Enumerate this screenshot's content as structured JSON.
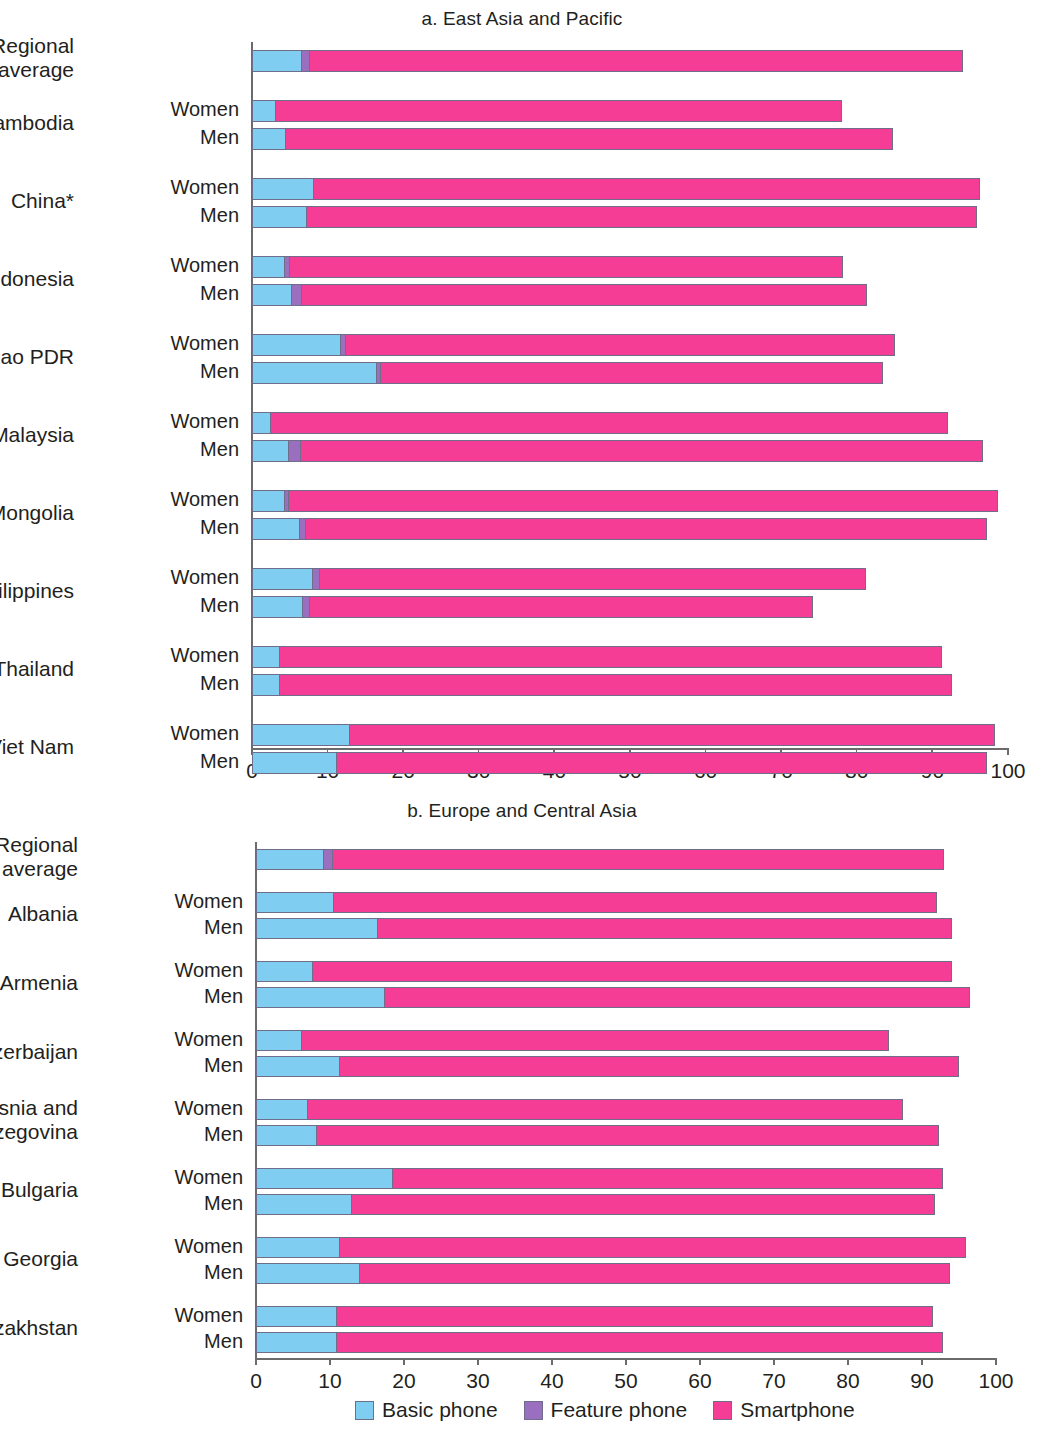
{
  "legend": {
    "items": [
      {
        "label": "Basic phone",
        "color": "#7fcdf0",
        "icon": "legend-swatch-basic"
      },
      {
        "label": "Feature phone",
        "color": "#9a6fc0",
        "icon": "legend-swatch-feature"
      },
      {
        "label": "Smartphone",
        "color": "#f53d96",
        "icon": "legend-swatch-smart"
      }
    ]
  },
  "gender": {
    "women": "Women",
    "men": "Men"
  },
  "chart_data": [
    {
      "type": "bar",
      "id": "panel-a",
      "title": "a. East Asia and Pacific",
      "orientation": "horizontal",
      "stacked": true,
      "xlabel": "",
      "ylabel": "",
      "xlim": [
        0,
        100
      ],
      "xticks": [
        0,
        10,
        20,
        30,
        40,
        50,
        60,
        70,
        80,
        90,
        100
      ],
      "grid": false,
      "legend_position": "bottom",
      "series": [
        {
          "name": "Basic phone",
          "color": "#7fcdf0"
        },
        {
          "name": "Feature phone",
          "color": "#9a6fc0"
        },
        {
          "name": "Smartphone",
          "color": "#f53d96"
        }
      ],
      "groups": [
        {
          "category": "Regional average",
          "single": true,
          "rows": [
            {
              "gender": "",
              "basic": 6.6,
              "feature": 1.1,
              "smart": 86.3,
              "total": 94.0
            }
          ]
        },
        {
          "category": "Cambodia",
          "single": false,
          "rows": [
            {
              "gender": "Women",
              "basic": 3.2,
              "feature": 0.0,
              "smart": 74.8,
              "total": 78.0
            },
            {
              "gender": "Men",
              "basic": 4.5,
              "feature": 0.0,
              "smart": 80.3,
              "total": 84.8
            }
          ]
        },
        {
          "category": "China*",
          "single": false,
          "rows": [
            {
              "gender": "Women",
              "basic": 8.2,
              "feature": 0.0,
              "smart": 88.1,
              "total": 96.3
            },
            {
              "gender": "Men",
              "basic": 7.3,
              "feature": 0.0,
              "smart": 88.6,
              "total": 95.9
            }
          ]
        },
        {
          "category": "Indonesia",
          "single": false,
          "rows": [
            {
              "gender": "Women",
              "basic": 4.4,
              "feature": 0.6,
              "smart": 73.2,
              "total": 78.2
            },
            {
              "gender": "Men",
              "basic": 5.3,
              "feature": 1.3,
              "smart": 74.7,
              "total": 81.3
            }
          ]
        },
        {
          "category": "Lao PDR",
          "single": false,
          "rows": [
            {
              "gender": "Women",
              "basic": 11.8,
              "feature": 0.6,
              "smart": 72.6,
              "total": 85.0
            },
            {
              "gender": "Men",
              "basic": 16.5,
              "feature": 0.6,
              "smart": 66.4,
              "total": 83.5
            }
          ]
        },
        {
          "category": "Malaysia",
          "single": false,
          "rows": [
            {
              "gender": "Women",
              "basic": 2.5,
              "feature": 0.0,
              "smart": 89.6,
              "total": 92.1
            },
            {
              "gender": "Men",
              "basic": 4.9,
              "feature": 1.6,
              "smart": 90.2,
              "total": 96.7
            }
          ]
        },
        {
          "category": "Mongolia",
          "single": false,
          "rows": [
            {
              "gender": "Women",
              "basic": 4.4,
              "feature": 0.5,
              "smart": 93.8,
              "total": 98.7
            },
            {
              "gender": "Men",
              "basic": 6.3,
              "feature": 0.9,
              "smart": 90.0,
              "total": 97.2
            }
          ]
        },
        {
          "category": "Philippines",
          "single": false,
          "rows": [
            {
              "gender": "Women",
              "basic": 8.1,
              "feature": 0.9,
              "smart": 72.2,
              "total": 81.2
            },
            {
              "gender": "Men",
              "basic": 6.8,
              "feature": 0.9,
              "smart": 66.5,
              "total": 74.2
            }
          ]
        },
        {
          "category": "Thailand",
          "single": false,
          "rows": [
            {
              "gender": "Women",
              "basic": 3.7,
              "feature": 0.0,
              "smart": 87.6,
              "total": 91.3
            },
            {
              "gender": "Men",
              "basic": 3.7,
              "feature": 0.0,
              "smart": 88.9,
              "total": 92.6
            }
          ]
        },
        {
          "category": "Viet Nam",
          "single": false,
          "rows": [
            {
              "gender": "Women",
              "basic": 13.0,
              "feature": 0.0,
              "smart": 85.3,
              "total": 98.3
            },
            {
              "gender": "Men",
              "basic": 11.2,
              "feature": 0.0,
              "smart": 86.0,
              "total": 97.2
            }
          ]
        }
      ]
    },
    {
      "type": "bar",
      "id": "panel-b",
      "title": "b. Europe and Central Asia",
      "orientation": "horizontal",
      "stacked": true,
      "xlabel": "",
      "ylabel": "",
      "xlim": [
        0,
        100
      ],
      "xticks": [
        0,
        10,
        20,
        30,
        40,
        50,
        60,
        70,
        80,
        90,
        100
      ],
      "grid": false,
      "legend_position": "bottom",
      "series": [
        {
          "name": "Basic phone",
          "color": "#7fcdf0"
        },
        {
          "name": "Feature phone",
          "color": "#9a6fc0"
        },
        {
          "name": "Smartphone",
          "color": "#f53d96"
        }
      ],
      "groups": [
        {
          "category": "Regional average",
          "single": true,
          "rows": [
            {
              "gender": "",
              "basic": 9.2,
              "feature": 1.2,
              "smart": 82.6,
              "total": 93.0
            }
          ]
        },
        {
          "category": "Albania",
          "single": false,
          "rows": [
            {
              "gender": "Women",
              "basic": 10.5,
              "feature": 0.0,
              "smart": 81.5,
              "total": 92.0
            },
            {
              "gender": "Men",
              "basic": 16.5,
              "feature": 0.0,
              "smart": 77.5,
              "total": 94.0
            }
          ]
        },
        {
          "category": "Armenia",
          "single": false,
          "rows": [
            {
              "gender": "Women",
              "basic": 7.7,
              "feature": 0.0,
              "smart": 86.3,
              "total": 94.0
            },
            {
              "gender": "Men",
              "basic": 17.4,
              "feature": 0.0,
              "smart": 79.1,
              "total": 96.5
            }
          ]
        },
        {
          "category": "Azerbaijan",
          "single": false,
          "rows": [
            {
              "gender": "Women",
              "basic": 6.2,
              "feature": 0.0,
              "smart": 79.3,
              "total": 85.5
            },
            {
              "gender": "Men",
              "basic": 11.4,
              "feature": 0.0,
              "smart": 83.6,
              "total": 95.0
            }
          ]
        },
        {
          "category": "Bosnia and Herzegovina",
          "single": false,
          "rows": [
            {
              "gender": "Women",
              "basic": 7.0,
              "feature": 0.0,
              "smart": 80.5,
              "total": 87.5
            },
            {
              "gender": "Men",
              "basic": 8.2,
              "feature": 0.0,
              "smart": 84.1,
              "total": 92.3
            }
          ]
        },
        {
          "category": "Bulgaria",
          "single": false,
          "rows": [
            {
              "gender": "Women",
              "basic": 18.5,
              "feature": 0.0,
              "smart": 74.3,
              "total": 92.8
            },
            {
              "gender": "Men",
              "basic": 13.0,
              "feature": 0.0,
              "smart": 78.7,
              "total": 91.7
            }
          ]
        },
        {
          "category": "Georgia",
          "single": false,
          "rows": [
            {
              "gender": "Women",
              "basic": 11.3,
              "feature": 0.0,
              "smart": 84.7,
              "total": 96.0
            },
            {
              "gender": "Men",
              "basic": 14.0,
              "feature": 0.0,
              "smart": 79.8,
              "total": 93.8
            }
          ]
        },
        {
          "category": "Kazakhstan",
          "single": false,
          "rows": [
            {
              "gender": "Women",
              "basic": 11.0,
              "feature": 0.0,
              "smart": 80.5,
              "total": 91.5
            },
            {
              "gender": "Men",
              "basic": 11.0,
              "feature": 0.0,
              "smart": 81.8,
              "total": 92.8
            }
          ]
        }
      ]
    }
  ]
}
